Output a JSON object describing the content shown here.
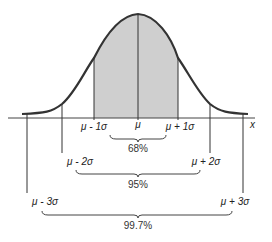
{
  "diagram": {
    "axis_label": "x",
    "center_label": "μ",
    "labels": {
      "minus1": "μ - 1σ",
      "plus1": "μ + 1σ",
      "minus2": "μ - 2σ",
      "plus2": "μ + 2σ",
      "minus3": "μ - 3σ",
      "plus3": "μ + 3σ"
    },
    "percentages": {
      "one_sigma": "68%",
      "two_sigma": "95%",
      "three_sigma": "99.7%"
    },
    "colors": {
      "curve": "#333333",
      "shade": "#cfcfcf",
      "axis": "#444444"
    }
  }
}
